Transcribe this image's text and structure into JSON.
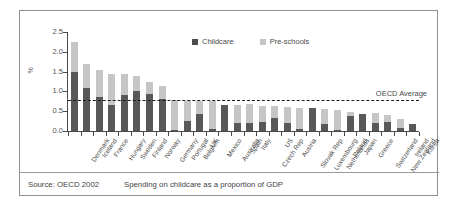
{
  "figure": {
    "source_note": "Source: OECD 2002",
    "caption": "Spending on childcare as a proportion of GDP"
  },
  "legend": {
    "position": "top-center",
    "items": [
      {
        "label": "Childcare",
        "color": "#4d4d4d",
        "swatch": "square-swatch"
      },
      {
        "label": "Pre-schools",
        "color": "#c6c6c6",
        "swatch": "square-swatch"
      }
    ]
  },
  "annotations": {
    "average_label": "OECD Average",
    "average_value": 0.78
  },
  "chart_data": {
    "type": "bar",
    "stacked": true,
    "title": "",
    "subtitle": "",
    "xlabel": "",
    "ylabel": "%",
    "ylim": [
      0.0,
      2.5
    ],
    "ytick_labels": [
      "0.0",
      "0.5",
      "1.0",
      "1.5",
      "2.0",
      "2.5"
    ],
    "ytick_values": [
      0.0,
      0.5,
      1.0,
      1.5,
      2.0,
      2.5
    ],
    "grid": false,
    "legend_position": "top-center",
    "categories": [
      "Denmark",
      "Iceland",
      "France",
      "Hungary",
      "Sweden",
      "Finland",
      "Norway",
      "Germany",
      "Portugal",
      "Belgium",
      "UK",
      "Mexico",
      "Australia",
      "Spain",
      "Italy",
      "Czech Rep",
      "US",
      "Austria",
      "Slovak Rep",
      "Luxembourg",
      "Netherlands",
      "Poland",
      "Japan",
      "Greece",
      "Switzerland",
      "New Zealand",
      "Ireland",
      "Korea"
    ],
    "series": [
      {
        "name": "Childcare",
        "color": "#585858",
        "values": [
          1.49,
          1.08,
          0.85,
          0.66,
          0.92,
          1.02,
          0.94,
          0.8,
          0.02,
          0.25,
          0.44,
          0.06,
          0.66,
          0.19,
          0.21,
          0.22,
          0.33,
          0.21,
          0.06,
          0.58,
          0.17,
          0.02,
          0.38,
          0.44,
          0.2,
          0.22,
          0.07,
          0.17
        ]
      },
      {
        "name": "Pre-schools",
        "color": "#c6c6c6",
        "values": [
          0.75,
          0.6,
          0.69,
          0.79,
          0.52,
          0.37,
          0.3,
          0.34,
          0.76,
          0.52,
          0.32,
          0.69,
          0.0,
          0.46,
          0.47,
          0.41,
          0.31,
          0.4,
          0.53,
          0.0,
          0.38,
          0.52,
          0.1,
          0.0,
          0.25,
          0.19,
          0.23,
          0.02
        ]
      }
    ],
    "totals": [
      2.24,
      1.68,
      1.54,
      1.45,
      1.44,
      1.39,
      1.24,
      1.14,
      0.78,
      0.77,
      0.76,
      0.75,
      0.66,
      0.65,
      0.68,
      0.63,
      0.64,
      0.61,
      0.59,
      0.58,
      0.55,
      0.54,
      0.48,
      0.44,
      0.45,
      0.41,
      0.3,
      0.19
    ]
  }
}
